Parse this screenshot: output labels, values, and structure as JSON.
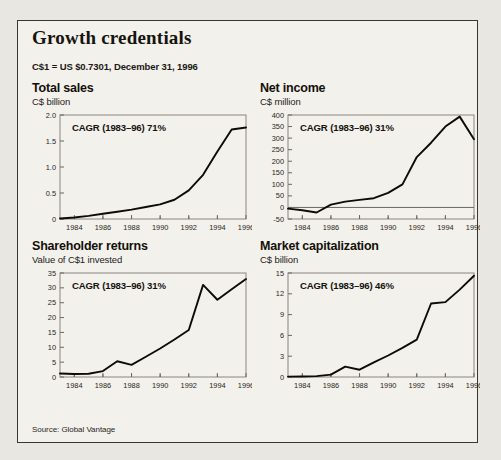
{
  "panel": {
    "title": "Growth credentials",
    "fx_note": "C$1 = US $0.7301, December 31, 1996",
    "source": "Source: Global Vantage",
    "background_color": "#f3f1ec",
    "border_color": "#3a3733",
    "line_color": "#0d0b07"
  },
  "chart_data": [
    {
      "id": "total-sales",
      "type": "line",
      "title": "Total sales",
      "unit": "C$ billion",
      "ylabel": "C$ billion",
      "xlabel": "",
      "annotation": "CAGR (1983–96) 71%",
      "ylim": [
        0,
        2.0
      ],
      "yticks": [
        0,
        0.5,
        1.0,
        1.5,
        2.0
      ],
      "ytick_labels": [
        "0",
        "0.5",
        "1.0",
        "1.5",
        "2.0"
      ],
      "xlim": [
        1983,
        1996
      ],
      "xticks": [
        1984,
        1986,
        1988,
        1990,
        1992,
        1994,
        1996
      ],
      "xtick_labels": [
        "1984",
        "1986",
        "1988",
        "1990",
        "1992",
        "1994",
        "1996"
      ],
      "grid": false,
      "legend": "none",
      "x": [
        1983,
        1984,
        1985,
        1986,
        1987,
        1988,
        1989,
        1990,
        1991,
        1992,
        1993,
        1994,
        1995,
        1996
      ],
      "values": [
        0.01,
        0.03,
        0.06,
        0.1,
        0.14,
        0.18,
        0.23,
        0.28,
        0.37,
        0.55,
        0.85,
        1.3,
        1.72,
        1.76
      ]
    },
    {
      "id": "net-income",
      "type": "line",
      "title": "Net income",
      "unit": "C$ million",
      "ylabel": "C$ million",
      "xlabel": "",
      "annotation": "CAGR (1983–96) 31%",
      "ylim": [
        -50,
        400
      ],
      "yticks": [
        -50,
        0,
        50,
        100,
        150,
        200,
        250,
        300,
        350,
        400
      ],
      "ytick_labels": [
        "-50",
        "0",
        "50",
        "100",
        "150",
        "200",
        "250",
        "300",
        "350",
        "400"
      ],
      "xlim": [
        1983,
        1996
      ],
      "xticks": [
        1984,
        1986,
        1988,
        1990,
        1992,
        1994,
        1996
      ],
      "xtick_labels": [
        "1984",
        "1986",
        "1988",
        "1990",
        "1992",
        "1994",
        "1996"
      ],
      "grid": false,
      "legend": "none",
      "x": [
        1983,
        1984,
        1985,
        1986,
        1987,
        1988,
        1989,
        1990,
        1991,
        1992,
        1993,
        1994,
        1995,
        1996
      ],
      "values": [
        -5,
        -12,
        -22,
        12,
        25,
        33,
        40,
        63,
        100,
        218,
        280,
        350,
        393,
        295
      ]
    },
    {
      "id": "shareholder-returns",
      "type": "line",
      "title": "Shareholder returns",
      "unit": "Value of C$1 invested",
      "ylabel": "Value of C$1 invested",
      "xlabel": "",
      "annotation": "CAGR (1983–96) 31%",
      "ylim": [
        0,
        35
      ],
      "yticks": [
        0,
        5,
        10,
        15,
        20,
        25,
        30,
        35
      ],
      "ytick_labels": [
        "0",
        "5",
        "10",
        "15",
        "20",
        "25",
        "30",
        "35"
      ],
      "xlim": [
        1983,
        1996
      ],
      "xticks": [
        1984,
        1986,
        1988,
        1990,
        1992,
        1994,
        1996
      ],
      "xtick_labels": [
        "1984",
        "1986",
        "1988",
        "1990",
        "1992",
        "1994",
        "1996"
      ],
      "grid": false,
      "legend": "none",
      "x": [
        1983,
        1984,
        1985,
        1986,
        1987,
        1988,
        1989,
        1990,
        1991,
        1992,
        1993,
        1994,
        1995,
        1996
      ],
      "values": [
        1.2,
        1.0,
        1.1,
        2.0,
        5.3,
        4.1,
        6.8,
        9.6,
        12.6,
        15.8,
        31.0,
        26.0,
        29.5,
        33.0
      ]
    },
    {
      "id": "market-capitalization",
      "type": "line",
      "title": "Market capitalization",
      "unit": "C$ billion",
      "ylabel": "C$ billion",
      "xlabel": "",
      "annotation": "CAGR (1983–96) 46%",
      "ylim": [
        0,
        15
      ],
      "yticks": [
        0,
        3,
        6,
        9,
        12,
        15
      ],
      "ytick_labels": [
        "0",
        "3",
        "6",
        "9",
        "12",
        "15"
      ],
      "xlim": [
        1983,
        1996
      ],
      "xticks": [
        1984,
        1986,
        1988,
        1990,
        1992,
        1994,
        1996
      ],
      "xtick_labels": [
        "1984",
        "1986",
        "1988",
        "1990",
        "1992",
        "1994",
        "1996"
      ],
      "grid": false,
      "legend": "none",
      "x": [
        1983,
        1984,
        1985,
        1986,
        1987,
        1988,
        1989,
        1990,
        1991,
        1992,
        1993,
        1994,
        1995,
        1996
      ],
      "values": [
        0.05,
        0.08,
        0.12,
        0.35,
        1.5,
        1.05,
        2.1,
        3.1,
        4.2,
        5.4,
        10.6,
        10.8,
        12.6,
        14.6
      ]
    }
  ]
}
